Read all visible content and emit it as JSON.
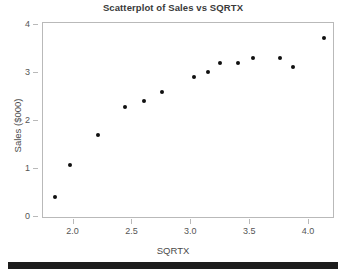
{
  "chart_data": {
    "type": "scatter",
    "title": "Scatterplot of Sales vs SQRTX",
    "xlabel": "SQRTX",
    "ylabel": "Sales ($000)",
    "xlim": [
      1.74,
      4.22
    ],
    "ylim": [
      -0.05,
      4.05
    ],
    "grid": false,
    "legend": null,
    "xticks": [
      2.0,
      2.5,
      3.0,
      3.5,
      4.0
    ],
    "xtick_labels": [
      "2.0",
      "2.5",
      "3.0",
      "3.5",
      "4.0"
    ],
    "yticks": [
      0,
      1,
      2,
      3,
      4
    ],
    "ytick_labels": [
      "0",
      "1",
      "2",
      "3",
      "4"
    ],
    "marker": "filled-circle",
    "marker_color": "#101010",
    "points": [
      {
        "x": 1.84,
        "y": 0.41
      },
      {
        "x": 1.97,
        "y": 1.09
      },
      {
        "x": 2.21,
        "y": 1.71
      },
      {
        "x": 2.44,
        "y": 2.3
      },
      {
        "x": 2.6,
        "y": 2.41
      },
      {
        "x": 2.75,
        "y": 2.61
      },
      {
        "x": 3.02,
        "y": 2.92
      },
      {
        "x": 3.14,
        "y": 3.02
      },
      {
        "x": 3.24,
        "y": 3.22
      },
      {
        "x": 3.4,
        "y": 3.22
      },
      {
        "x": 3.52,
        "y": 3.32
      },
      {
        "x": 3.75,
        "y": 3.31
      },
      {
        "x": 3.86,
        "y": 3.14
      },
      {
        "x": 4.13,
        "y": 3.73
      }
    ],
    "x": [
      1.84,
      1.97,
      2.21,
      2.44,
      2.6,
      2.75,
      3.02,
      3.14,
      3.24,
      3.4,
      3.52,
      3.75,
      3.86,
      4.13
    ],
    "y": [
      0.41,
      1.09,
      1.71,
      2.3,
      2.41,
      2.61,
      2.92,
      3.02,
      3.22,
      3.22,
      3.32,
      3.31,
      3.14,
      3.73
    ]
  },
  "colors": {
    "marker": "#101010",
    "frame": "#b9b9b9",
    "title_text": "#3a3a3a",
    "axis_text": "#555555",
    "background": "#ffffff",
    "footer_bar": "#1c1c1c"
  }
}
